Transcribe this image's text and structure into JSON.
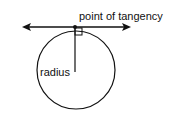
{
  "diagram": {
    "labels": {
      "point_of_tangency": "point of tangency",
      "radius": "radius"
    },
    "colors": {
      "stroke": "#111111",
      "background": "#ffffff"
    }
  }
}
